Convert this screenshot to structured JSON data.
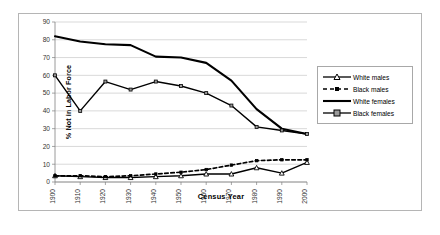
{
  "chart_data": {
    "type": "line",
    "title": "",
    "xlabel": "Census Year",
    "ylabel": "% Not in Labor Force",
    "categories": [
      "1900",
      "1910",
      "1920",
      "1930",
      "1940",
      "1950",
      "1960",
      "1970",
      "1980",
      "1990",
      "2000"
    ],
    "x": [
      1900,
      1910,
      1920,
      1930,
      1940,
      1950,
      1960,
      1970,
      1980,
      1990,
      2000
    ],
    "ylim": [
      0,
      90
    ],
    "ytick_step": 10,
    "yticks": [
      "0",
      "10",
      "20",
      "30",
      "40",
      "50",
      "60",
      "70",
      "80",
      "90"
    ],
    "grid": "horizontal",
    "legend_position": "right",
    "series": [
      {
        "name": "White males",
        "marker": "triangle",
        "line": "solid",
        "values": [
          3.5,
          3.0,
          2.5,
          2.5,
          3.0,
          3.5,
          4.5,
          4.5,
          8.0,
          5.0,
          11.0
        ]
      },
      {
        "name": "Black males",
        "marker": "square",
        "line": "dashed",
        "values": [
          3.5,
          3.5,
          3.0,
          3.5,
          4.5,
          5.5,
          7.0,
          9.5,
          12.0,
          12.5,
          12.5
        ]
      },
      {
        "name": "White females",
        "marker": "none",
        "line": "solid",
        "values": [
          82.0,
          79.0,
          77.5,
          77.0,
          70.5,
          70.0,
          67.0,
          57.0,
          41.0,
          30.0,
          27.0
        ]
      },
      {
        "name": "Black females",
        "marker": "square",
        "line": "solid",
        "values": [
          60.0,
          40.0,
          56.5,
          52.0,
          56.5,
          54.0,
          50.0,
          43.0,
          31.0,
          29.0,
          27.0
        ]
      }
    ]
  },
  "legend": {
    "items": [
      {
        "label": "White males"
      },
      {
        "label": "Black males"
      },
      {
        "label": "White females"
      },
      {
        "label": "Black females"
      }
    ]
  }
}
